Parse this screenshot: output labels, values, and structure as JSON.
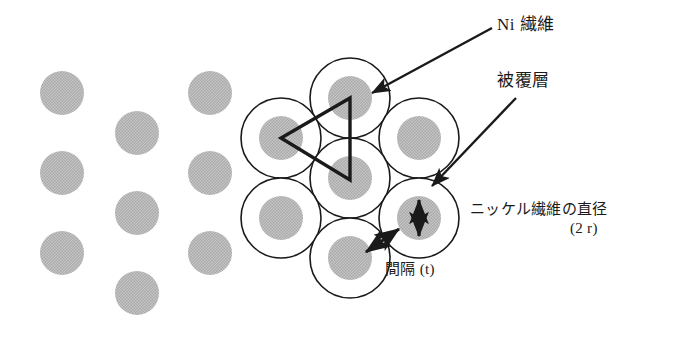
{
  "figure": {
    "background_color": "#ffffff",
    "fiber_fill_color": "#bdbdbd",
    "coating_stroke_color": "#1a1a1a",
    "annotation_color": "#1a1a1a",
    "width": 674,
    "height": 350
  },
  "labels": {
    "ni_fiber": "Ni 繊維",
    "coating_layer": "被覆層",
    "fiber_diameter_main": "ニッケル繊維の直径",
    "fiber_diameter_symbol": "(2 r)",
    "spacing": "間隔 (t)"
  },
  "geometry": {
    "fiber_radius": 22,
    "coating_radius": 40,
    "plain_dot_radius": 22,
    "plain_dots": [
      {
        "cx": 62,
        "cy": 93
      },
      {
        "cx": 62,
        "cy": 173
      },
      {
        "cx": 62,
        "cy": 253
      },
      {
        "cx": 137,
        "cy": 133
      },
      {
        "cx": 137,
        "cy": 213
      },
      {
        "cx": 137,
        "cy": 293
      },
      {
        "cx": 210,
        "cy": 93
      },
      {
        "cx": 210,
        "cy": 173
      },
      {
        "cx": 210,
        "cy": 253
      }
    ],
    "coated_fibers": [
      {
        "cx": 350,
        "cy": 98
      },
      {
        "cx": 281,
        "cy": 138
      },
      {
        "cx": 419,
        "cy": 138
      },
      {
        "cx": 350,
        "cy": 178
      },
      {
        "cx": 281,
        "cy": 218
      },
      {
        "cx": 419,
        "cy": 218
      },
      {
        "cx": 350,
        "cy": 258
      }
    ],
    "triangle_vertices": [
      {
        "x": 350,
        "y": 98
      },
      {
        "x": 281,
        "y": 138
      },
      {
        "x": 350,
        "y": 180
      }
    ]
  },
  "annotations": {
    "ni_fiber_leader": {
      "from_x": 492,
      "from_y": 28,
      "to_x": 368,
      "to_y": 94,
      "arrow_at": "to"
    },
    "coating_leader": {
      "from_x": 512,
      "from_y": 96,
      "to_x": 428,
      "to_y": 185,
      "arrow_at": "to"
    },
    "diameter_arrow": {
      "x": 419,
      "top_y": 197,
      "bottom_y": 239,
      "double_headed": true
    },
    "spacing_arrow": {
      "from_x": 363,
      "from_y": 255,
      "to_x": 401,
      "to_y": 228,
      "double_headed": true
    }
  }
}
